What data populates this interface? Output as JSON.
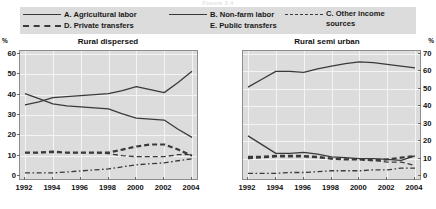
{
  "figure": {
    "cut_title": "Figure 2.4",
    "unit_label_left": "%",
    "unit_label_right": "%"
  },
  "legend": {
    "items": [
      {
        "key": "solid",
        "label": "A. Agricultural labor",
        "column": 1,
        "row": 1
      },
      {
        "key": "dash-bold",
        "label": "D. Private transfers",
        "column": 1,
        "row": 2
      },
      {
        "key": "solid",
        "label": "B. Non-farm labor",
        "column": 2,
        "row": 1
      },
      {
        "key": "dash-dot",
        "label": "E. Public transfers",
        "column": 2,
        "row": 2
      },
      {
        "key": "dash",
        "label": "C. Other income\nsources",
        "column": 3,
        "row": 1
      }
    ]
  },
  "chart_data": [
    {
      "type": "line",
      "title": "Rural dispersed",
      "xlabel": "",
      "ylabel": "%",
      "x": [
        1992,
        1993,
        1994,
        1995,
        1996,
        1997,
        1998,
        1999,
        2000,
        2001,
        2002,
        2003,
        2004
      ],
      "xticks": [
        1992,
        1994,
        1996,
        1998,
        2000,
        2002,
        2004
      ],
      "ylim": [
        0,
        60
      ],
      "yticks": [
        0,
        10,
        20,
        30,
        40,
        50,
        60
      ],
      "grid": true,
      "legend_position": "top-external",
      "series": [
        {
          "name": "A. Agricultural labor",
          "style": "solid",
          "values": [
            40.5,
            38.0,
            35.5,
            34.5,
            34.0,
            33.5,
            33.0,
            30.5,
            28.5,
            28.0,
            27.5,
            23.0,
            19.0
          ]
        },
        {
          "name": "B. Non-farm labor",
          "style": "solid",
          "values": [
            35.0,
            36.5,
            38.5,
            39.0,
            39.5,
            40.0,
            40.5,
            42.0,
            44.0,
            42.5,
            41.0,
            46.0,
            51.5
          ]
        },
        {
          "name": "C. Other income sources",
          "style": "dash",
          "values": [
            11.5,
            11.5,
            11.5,
            11.5,
            11.5,
            11.5,
            11.0,
            10.0,
            9.5,
            9.5,
            9.5,
            10.5,
            10.5
          ]
        },
        {
          "name": "D. Private transfers",
          "style": "dash-bold",
          "values": [
            11.5,
            11.5,
            12.0,
            11.5,
            11.5,
            11.5,
            11.5,
            13.0,
            14.5,
            15.5,
            15.5,
            13.0,
            10.0
          ]
        },
        {
          "name": "E. Public transfers",
          "style": "dash-dot",
          "values": [
            1.5,
            1.5,
            1.5,
            2.0,
            2.5,
            3.0,
            3.5,
            4.5,
            5.5,
            6.0,
            6.5,
            7.5,
            8.5
          ]
        }
      ]
    },
    {
      "type": "line",
      "title": "Rural semi urban",
      "xlabel": "",
      "ylabel": "%",
      "x": [
        1992,
        1993,
        1994,
        1995,
        1996,
        1997,
        1998,
        1999,
        2000,
        2001,
        2002,
        2003,
        2004
      ],
      "xticks": [
        1992,
        1994,
        1996,
        1998,
        2000,
        2002,
        2004
      ],
      "ylim": [
        0,
        70
      ],
      "yticks": [
        0,
        10,
        20,
        30,
        40,
        50,
        60,
        70
      ],
      "grid": true,
      "legend_position": "top-external",
      "series": [
        {
          "name": "A. Agricultural labor",
          "style": "solid",
          "values": [
            23.0,
            18.0,
            13.0,
            13.0,
            13.5,
            12.5,
            11.0,
            10.5,
            10.0,
            10.0,
            9.5,
            9.0,
            11.5
          ]
        },
        {
          "name": "B. Non-farm labor",
          "style": "solid",
          "values": [
            51.0,
            55.5,
            60.0,
            60.0,
            59.5,
            61.5,
            63.0,
            64.5,
            65.5,
            65.0,
            64.0,
            63.0,
            62.0
          ]
        },
        {
          "name": "C. Other income sources",
          "style": "dash",
          "values": [
            10.0,
            10.5,
            11.0,
            11.0,
            11.0,
            10.5,
            10.0,
            9.5,
            9.5,
            9.0,
            8.0,
            8.0,
            6.0
          ]
        },
        {
          "name": "D. Private transfers",
          "style": "dash-bold",
          "values": [
            11.0,
            11.0,
            11.5,
            11.5,
            11.5,
            11.0,
            10.0,
            9.5,
            9.5,
            9.0,
            9.5,
            10.5,
            11.5
          ]
        },
        {
          "name": "E. Public transfers",
          "style": "dash-dot",
          "values": [
            1.5,
            1.5,
            1.5,
            2.0,
            2.0,
            2.5,
            3.0,
            3.0,
            3.0,
            3.5,
            3.5,
            4.5,
            4.5
          ]
        }
      ]
    }
  ]
}
